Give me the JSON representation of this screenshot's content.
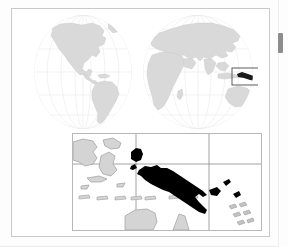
{
  "document": {
    "type": "locator-map-figure",
    "subject": "Papua New Guinea",
    "caption": ""
  },
  "world_map": {
    "name": "world-locator-map",
    "projection": "two-hemisphere interrupted globe",
    "hemispheres": [
      {
        "name": "western-hemisphere",
        "label": "Americas"
      },
      {
        "name": "eastern-hemisphere",
        "label": "Europe Africa Asia Oceania"
      }
    ],
    "highlight_box": {
      "name": "papua-new-guinea-highlight",
      "visible": true
    },
    "colors": {
      "land": "#d9d9d9",
      "land_stroke": "#c0c0c0",
      "ocean": "#ffffff",
      "graticule": "#e6e6e6",
      "globe_outline": "#d2d2d2",
      "highlight_box_stroke": "#4a4a4a",
      "highlight_fill": "#1a1a1a"
    }
  },
  "detail_map": {
    "name": "papua-new-guinea-detail-map",
    "highlighted_country": "Papua New Guinea",
    "neighbour_landmasses": [
      "Indonesia (Papua / Maluku)",
      "Australia (Cape York)",
      "New Britain",
      "New Ireland",
      "Bougainville",
      "Solomon Islands"
    ],
    "graticule": {
      "vertical_lines": 2,
      "horizontal_lines": 1
    },
    "colors": {
      "highlight": "#000000",
      "other_land": "#d4d4d4",
      "other_land_stroke": "#9e9e9e",
      "ocean": "#ffffff",
      "graticule": "#8a8a8a",
      "border": "#b7b7b7"
    }
  },
  "frame": {
    "name": "figure-frame",
    "border_color": "#c9c9c9",
    "background": "#ffffff"
  },
  "scrollbar": {
    "name": "vertical-scrollbar",
    "thumb_color": "#8d8d8d",
    "track_color": "#fdfdfd",
    "position_percent": 14
  }
}
